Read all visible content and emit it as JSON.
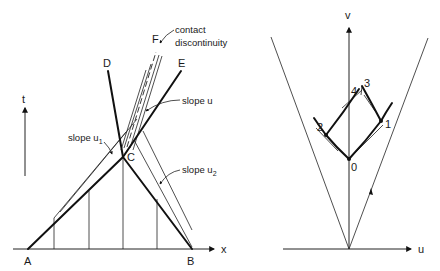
{
  "left_panel": {
    "axis_labels": {
      "time": "t",
      "space": "x"
    },
    "point_labels": {
      "A": "A",
      "B": "B",
      "C": "C",
      "D": "D",
      "E": "E",
      "F": "F"
    },
    "annotations": {
      "contact_line1": "contact",
      "contact_line2": "discontinuity",
      "slope_u": "slope u",
      "slope_u1_base": "slope u",
      "slope_u1_sub": "1",
      "slope_u2_base": "slope u",
      "slope_u2_sub": "2"
    }
  },
  "right_panel": {
    "axis_labels": {
      "vertical": "v",
      "horizontal": "u"
    },
    "point_labels": {
      "p0": "0",
      "p1": "1",
      "p2": "2",
      "p3": "3",
      "p4": "4"
    }
  }
}
